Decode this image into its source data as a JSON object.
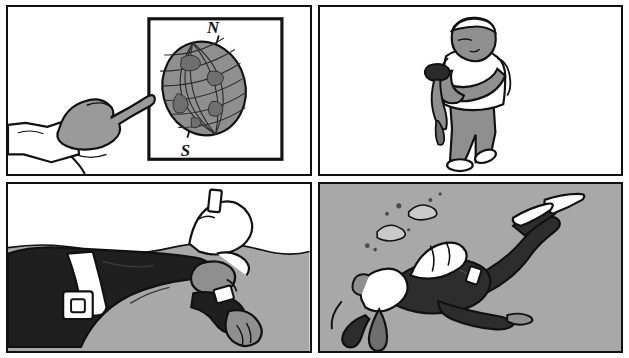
{
  "comic": {
    "title": "Underwater Navigation Sequence",
    "page_background": "#ffffff",
    "ink_color": "#111111",
    "panel_count": 4,
    "panels": [
      {
        "id": "panel-1",
        "position": "top-left",
        "scene": "Instructor hand pointing at a globe poster",
        "background": "#ffffff",
        "labels": {
          "north": "N",
          "south": "S"
        },
        "elements": [
          "framed-globe-poster",
          "globe",
          "globe-axis",
          "pointing-hand",
          "forearm",
          "shirt-cuff"
        ],
        "colors": {
          "globe_fill": "#8f8f8f",
          "skin_fill": "#9a9a9a",
          "frame_stroke": "#111111"
        }
      },
      {
        "id": "panel-2",
        "position": "top-right",
        "scene": "Person standing, reading a hand-held compass",
        "background": "#ffffff",
        "elements": [
          "standing-person",
          "head",
          "white-tshirt",
          "gray-trousers",
          "white-shoes",
          "hand-held-compass",
          "compass-lanyard"
        ],
        "colors": {
          "shirt_fill": "#ffffff",
          "trousers_fill": "#8f8f8f",
          "skin_fill": "#9a9a9a",
          "compass_fill": "#2b2b2b"
        }
      },
      {
        "id": "panel-3",
        "position": "bottom-left",
        "scene": "Scuba diver floating at the surface taking a compass bearing",
        "background": "#ffffff",
        "water_fill": "#a8a8a8",
        "elements": [
          "water-surface-line",
          "floating-diver",
          "black-wetsuit",
          "white-weight-belt",
          "belt-buckle",
          "scuba-tank",
          "tank-valve",
          "diver-mask",
          "diver-hand",
          "wrist-compass"
        ],
        "colors": {
          "wetsuit_fill": "#1f1f1f",
          "belt_fill": "#ffffff",
          "tank_fill": "#ffffff",
          "water_fill": "#a8a8a8",
          "skin_fill": "#8f8f8f"
        }
      },
      {
        "id": "panel-4",
        "position": "bottom-right",
        "scene": "Diver swimming underwater following a compass heading, exhaust bubbles rising",
        "background": "#a8a8a8",
        "elements": [
          "swimming-diver",
          "scuba-tank",
          "black-wetsuit",
          "white-fins",
          "diver-hood",
          "regulator-hose",
          "air-bubbles",
          "outstretched-arm"
        ],
        "bubble_count": 2,
        "colors": {
          "water_fill": "#a8a8a8",
          "wetsuit_fill": "#2d2d2d",
          "tank_fill": "#ffffff",
          "fins_fill": "#ffffff",
          "bubble_fill": "#c9c9c9"
        }
      }
    ]
  }
}
